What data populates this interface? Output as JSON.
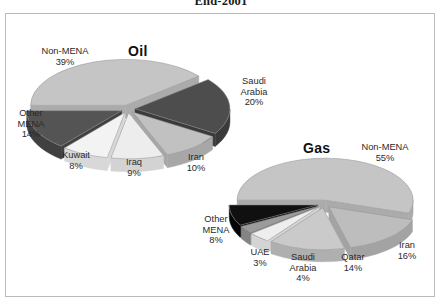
{
  "document": {
    "title": "End-2001"
  },
  "chart_data": [
    {
      "type": "pie",
      "title": "Oil",
      "note": "exploded 3D pie, shares of proven oil reserves, end-2001",
      "legend_position": "callout-labels",
      "categories": [
        "Non-MENA",
        "Saudi Arabia",
        "Iran",
        "Iraq",
        "Kuwait",
        "Other MENA"
      ],
      "values": [
        39,
        20,
        10,
        9,
        8,
        14
      ],
      "unit": "%",
      "slices": [
        {
          "name": "Non-MENA",
          "value": 39,
          "label": "Non-MENA",
          "value_label": "39%",
          "color": "#c4c5c4",
          "side": "#aaabaa"
        },
        {
          "name": "Saudi Arabia",
          "value": 20,
          "label": "Saudi\nArabia",
          "value_label": "20%",
          "color": "#4d4d4d",
          "side": "#3a3a3a"
        },
        {
          "name": "Iran",
          "value": 10,
          "label": "Iran",
          "value_label": "10%",
          "color": "#c0c1c0",
          "side": "#a6a7a6"
        },
        {
          "name": "Iraq",
          "value": 9,
          "label": "Iraq",
          "value_label": "9%",
          "color": "#ededed",
          "side": "#d3d3d3"
        },
        {
          "name": "Kuwait",
          "value": 8,
          "label": "Kuwait",
          "value_label": "8%",
          "color": "#f3f3f3",
          "side": "#d8d8d8"
        },
        {
          "name": "Other MENA",
          "value": 14,
          "label": "Other\nMENA",
          "value_label": "14%",
          "color": "#545454",
          "side": "#404040"
        }
      ]
    },
    {
      "type": "pie",
      "title": "Gas",
      "note": "exploded 3D pie, shares of proven gas reserves, end-2001",
      "legend_position": "callout-labels",
      "categories": [
        "Non-MENA",
        "Iran",
        "Qatar",
        "Saudi Arabia",
        "UAE",
        "Other MENA"
      ],
      "values": [
        55,
        16,
        14,
        4,
        3,
        8
      ],
      "unit": "%",
      "slices": [
        {
          "name": "Non-MENA",
          "value": 55,
          "label": "Non-MENA",
          "value_label": "55%",
          "color": "#c4c5c4",
          "side": "#aaabaa"
        },
        {
          "name": "Iran",
          "value": 16,
          "label": "Iran",
          "value_label": "16%",
          "color": "#bcbdbc",
          "side": "#a2a3a2"
        },
        {
          "name": "Qatar",
          "value": 14,
          "label": "Qatar",
          "value_label": "14%",
          "color": "#c9cac9",
          "side": "#aeafae"
        },
        {
          "name": "Saudi Arabia",
          "value": 4,
          "label": "Saudi\nArabia",
          "value_label": "4%",
          "color": "#eeeeee",
          "side": "#d4d4d4"
        },
        {
          "name": "UAE",
          "value": 3,
          "label": "UAE",
          "value_label": "3%",
          "color": "#9a9b9a",
          "side": "#838483"
        },
        {
          "name": "Other MENA",
          "value": 8,
          "label": "Other\nMENA",
          "value_label": "8%",
          "color": "#101010",
          "side": "#050505"
        }
      ]
    }
  ],
  "labels": {
    "oil": {
      "non_mena": {
        "name": "Non-MENA",
        "pct": "39%"
      },
      "saudi_arabia": {
        "name": "Saudi",
        "name2": "Arabia",
        "pct": "20%"
      },
      "iran": {
        "name": "Iran",
        "pct": "10%"
      },
      "iraq": {
        "name": "Iraq",
        "pct": "9%"
      },
      "kuwait": {
        "name": "Kuwait",
        "pct": "8%"
      },
      "other_mena": {
        "name": "Other",
        "name2": "MENA",
        "pct": "14%"
      }
    },
    "gas": {
      "non_mena": {
        "name": "Non-MENA",
        "pct": "55%"
      },
      "iran": {
        "name": "Iran",
        "pct": "16%"
      },
      "qatar": {
        "name": "Qatar",
        "pct": "14%"
      },
      "saudi_arabia": {
        "name": "Saudi",
        "name2": "Arabia",
        "pct": "4%"
      },
      "uae": {
        "name": "UAE",
        "pct": "3%"
      },
      "other_mena": {
        "name": "Other",
        "name2": "MENA",
        "pct": "8%"
      }
    }
  },
  "colors": {
    "frame_border": "#b9bcbe",
    "background": "#ffffff",
    "text": "#2a2a2a",
    "title_text": "#101010"
  }
}
